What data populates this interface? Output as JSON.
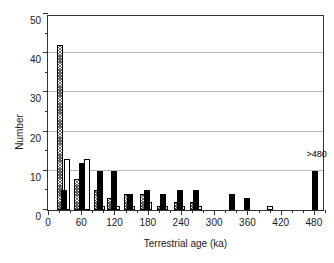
{
  "chart_data": {
    "type": "bar",
    "title": "",
    "subtitle": "",
    "xlabel": "Terrestrial age (ka)",
    "ylabel": "Number",
    "xlim": [
      0,
      500
    ],
    "ylim": [
      0,
      50
    ],
    "grid": true,
    "legend_position": "none",
    "x_ticks": [
      0,
      60,
      120,
      180,
      240,
      300,
      360,
      420,
      480
    ],
    "x_minor_tick_interval": 20,
    "y_ticks": [
      0,
      10,
      20,
      30,
      40,
      50
    ],
    "y_minor_tick_interval": 5,
    "bin_width": 20,
    "annotations": [
      {
        "text": ">480",
        "x": 485,
        "y": 13
      }
    ],
    "series": [
      {
        "name": "hatched",
        "style": "hatched",
        "bars": [
          {
            "x": 22,
            "value": 42
          },
          {
            "x": 52,
            "value": 8
          },
          {
            "x": 88,
            "value": 5
          },
          {
            "x": 112,
            "value": 3
          },
          {
            "x": 142,
            "value": 4
          },
          {
            "x": 172,
            "value": 4
          },
          {
            "x": 202,
            "value": 1
          },
          {
            "x": 232,
            "value": 2
          },
          {
            "x": 262,
            "value": 2
          }
        ]
      },
      {
        "name": "open",
        "style": "open",
        "bars": [
          {
            "x": 34,
            "value": 13
          },
          {
            "x": 70,
            "value": 13
          },
          {
            "x": 98,
            "value": 1
          },
          {
            "x": 125,
            "value": 1
          },
          {
            "x": 152,
            "value": 1
          },
          {
            "x": 182,
            "value": 2
          },
          {
            "x": 212,
            "value": 1
          },
          {
            "x": 242,
            "value": 1
          },
          {
            "x": 272,
            "value": 1
          },
          {
            "x": 400,
            "value": 1
          }
        ]
      },
      {
        "name": "solid",
        "style": "solid",
        "bars": [
          {
            "x": 28,
            "value": 5
          },
          {
            "x": 62,
            "value": 12
          },
          {
            "x": 94,
            "value": 10
          },
          {
            "x": 119,
            "value": 10
          },
          {
            "x": 148,
            "value": 4
          },
          {
            "x": 178,
            "value": 5
          },
          {
            "x": 208,
            "value": 4
          },
          {
            "x": 238,
            "value": 5
          },
          {
            "x": 268,
            "value": 5
          },
          {
            "x": 332,
            "value": 4
          },
          {
            "x": 360,
            "value": 3
          },
          {
            "x": 482,
            "value": 10
          }
        ]
      }
    ]
  }
}
